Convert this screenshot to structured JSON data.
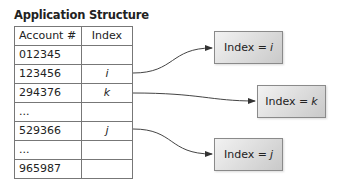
{
  "title": "Application Structure",
  "table": {
    "headers": [
      "Account #",
      "Index"
    ],
    "rows": [
      {
        "account": "012345",
        "index": ""
      },
      {
        "account": "123456",
        "index": "i"
      },
      {
        "account": "294376",
        "index": "k"
      },
      {
        "account": "...",
        "index": ""
      },
      {
        "account": "529366",
        "index": "j"
      },
      {
        "account": "...",
        "index": ""
      },
      {
        "account": "965987",
        "index": ""
      }
    ]
  },
  "boxes": [
    {
      "label": "Index =",
      "var": "i"
    },
    {
      "label": "Index =",
      "var": "k"
    },
    {
      "label": "Index =",
      "var": "j"
    }
  ]
}
